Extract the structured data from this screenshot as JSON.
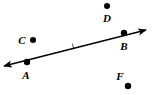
{
  "figure": {
    "type": "geometry-diagram",
    "width": 153,
    "height": 95,
    "background_color": "#ffffff",
    "ink_color": "#000000",
    "line": {
      "name": "line-AB",
      "description": "double-headed straight line passing through points A and B",
      "arrowheads": "both",
      "start_x": 4,
      "start_y": 66,
      "end_x": 146,
      "end_y": 30,
      "stroke_width": 1.4
    },
    "tick_mark": {
      "name": "tick-mark",
      "x": 73,
      "y": 46,
      "description": "small hash mark on the line between A and B"
    },
    "points": [
      {
        "id": "A",
        "label": "A",
        "dot_x": 27,
        "dot_y": 62,
        "dot_r": 3.2,
        "label_x": 26,
        "label_y": 75,
        "on_line": true
      },
      {
        "id": "B",
        "label": "B",
        "dot_x": 124,
        "dot_y": 33,
        "dot_r": 3.2,
        "label_x": 124,
        "label_y": 46,
        "on_line": true
      },
      {
        "id": "C",
        "label": "C",
        "dot_x": 33,
        "dot_y": 40,
        "dot_r": 3.0,
        "label_x": 22,
        "label_y": 40,
        "on_line": false
      },
      {
        "id": "D",
        "label": "D",
        "dot_x": 107,
        "dot_y": 6,
        "dot_r": 3.0,
        "label_x": 107,
        "label_y": 18,
        "on_line": false
      },
      {
        "id": "F",
        "label": "F",
        "dot_x": 128,
        "dot_y": 86,
        "dot_r": 3.2,
        "label_x": 120,
        "label_y": 76,
        "on_line": false
      }
    ]
  }
}
